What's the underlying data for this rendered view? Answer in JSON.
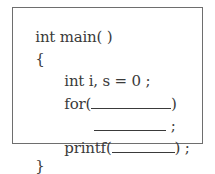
{
  "code": {
    "lines": [
      {
        "text": "int main( )",
        "indent": 0
      },
      {
        "text": "{",
        "indent": 0
      },
      {
        "text": "int i, s = 0 ;",
        "indent": 1
      },
      {
        "prefix": "for(",
        "blank": "",
        "suffix": ")",
        "indent": 1
      },
      {
        "prefix": "",
        "blank": "",
        "suffix": " ;",
        "indent": 2
      },
      {
        "prefix": "printf(",
        "blank": "",
        "suffix": ") ;",
        "indent": 1
      },
      {
        "text": "}",
        "indent": 0
      }
    ]
  },
  "colors": {
    "border": "#6e6e6e",
    "text": "#3a3a3a",
    "background": "#ffffff"
  }
}
